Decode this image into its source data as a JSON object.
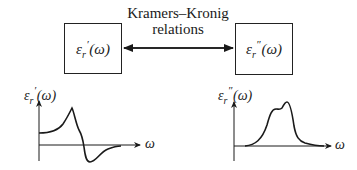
{
  "relation": {
    "line1": "Kramers–Kronig",
    "line2": "relations",
    "arrow": "bidirectional"
  },
  "left_box": {
    "symbol": "ε",
    "sub": "r",
    "prime": "′",
    "arg": "(ω)"
  },
  "right_box": {
    "symbol": "ε",
    "sub": "r",
    "prime": "″",
    "arg": "(ω)"
  },
  "left_plot": {
    "ylabel": {
      "symbol": "ε",
      "sub": "r",
      "prime": "′",
      "arg": "(ω)"
    },
    "xlabel": "ω",
    "description": "Real part: rises from a positive offset to a sharp maximum, drops through zero to a negative minimum, then relaxes back toward zero"
  },
  "right_plot": {
    "ylabel": {
      "symbol": "ε",
      "sub": "r",
      "prime": "″",
      "arg": "(ω)"
    },
    "xlabel": "ω",
    "description": "Imaginary part: absorption band with a shoulder and a main peak, zero elsewhere"
  },
  "colors": {
    "stroke": "#1a1a1a",
    "background": "#ffffff"
  }
}
